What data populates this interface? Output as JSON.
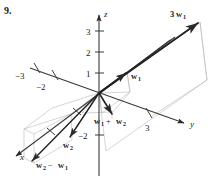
{
  "exercise": {
    "number": "9."
  },
  "figure": {
    "type": "3d-vector-diagram",
    "axes": [
      {
        "name": "x",
        "label": "x",
        "label_x": 20,
        "label_y": 160,
        "direction": "down-left-front"
      },
      {
        "name": "y",
        "label": "y",
        "label_x": 190,
        "label_y": 127,
        "direction": "down-right"
      },
      {
        "name": "z",
        "label": "z",
        "label_x": 104,
        "label_y": 17,
        "direction": "up"
      }
    ],
    "tick_labels": [
      {
        "axis": "z",
        "text": "3",
        "x": 88,
        "y": 35
      },
      {
        "axis": "z",
        "text": "2",
        "x": 88,
        "y": 56
      },
      {
        "axis": "z",
        "text": "1",
        "x": 88,
        "y": 77
      },
      {
        "axis": "z",
        "text": "−2",
        "x": 80,
        "y": 139
      },
      {
        "axis": "y",
        "text": "3",
        "x": 147,
        "y": 131
      },
      {
        "axis": "y-negative",
        "text": "−3",
        "x": 17,
        "y": 79
      },
      {
        "axis": "y-negative",
        "text": "−2",
        "x": 38,
        "y": 90
      }
    ],
    "vectors": [
      {
        "name": "w1",
        "base": "w",
        "subscript": "1",
        "coefficient": "",
        "label_x": 131,
        "label_y": 79,
        "tip_x": 127,
        "tip_y": 72
      },
      {
        "name": "3w1",
        "base": "w",
        "subscript": "1",
        "coefficient": "3",
        "label_x": 172,
        "label_y": 17,
        "tip_x": 200,
        "tip_y": 22
      },
      {
        "name": "w1-plus-w2",
        "base": "w",
        "subscript": "1",
        "coefficient": "",
        "label_x": 95,
        "label_y": 124,
        "tip_x": 112,
        "tip_y": 111
      },
      {
        "name": "w2",
        "base": "w",
        "subscript": "2",
        "coefficient": "",
        "label_x": 64,
        "label_y": 148,
        "tip_x": 71,
        "tip_y": 136
      },
      {
        "name": "w2-minus-w1",
        "base": "w",
        "subscript": "2",
        "coefficient": "",
        "label_x": 37,
        "label_y": 168,
        "tip_x": 33,
        "tip_y": 160
      }
    ],
    "vector_labels": {
      "w1": "w",
      "w1_sub": "1",
      "three_w1_coef": "3",
      "three_w1": "w",
      "three_w1_sub": "1",
      "sum_first": "w",
      "sum_first_sub": "1",
      "sum_op": "+",
      "sum_second": "w",
      "sum_second_sub": "2",
      "w2": "w",
      "w2_sub": "2",
      "diff_first": "w",
      "diff_first_sub": "2",
      "diff_op": "−",
      "diff_second": "w",
      "diff_second_sub": "1"
    },
    "colors": {
      "ink": "#1a1a1a",
      "axis": "#3a3a3a",
      "guide": "#b8b8b8",
      "background": "#ffffff"
    },
    "origin": {
      "x": 99,
      "y": 93
    }
  }
}
